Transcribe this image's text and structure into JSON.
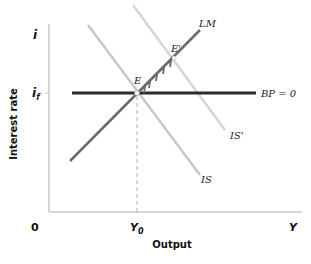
{
  "diagram": {
    "title": "",
    "axes": {
      "y_label": "Interest rate",
      "x_label": "Output",
      "origin_label": "0",
      "y_end_label": "i",
      "x_end_label": "Y",
      "y_tick_label": "i",
      "y_tick_subscript": "f",
      "x_tick_label": "Y",
      "x_tick_subscript": "0"
    },
    "curves": {
      "lm": {
        "label": "LM",
        "color": "#6b6b6b"
      },
      "is": {
        "label": "IS",
        "color": "#c8c8c8"
      },
      "is_prime": {
        "label": "IS'",
        "color": "#d6d6d6"
      },
      "bp": {
        "label": "BP = 0",
        "color": "#2a2a2a"
      }
    },
    "points": {
      "e": {
        "label": "E"
      },
      "e_prime": {
        "label": "E'"
      }
    },
    "colors": {
      "axis": "#c9c9c9",
      "arrows": "#6b6b6b",
      "dashed_guide": "#b0b0b0"
    }
  }
}
